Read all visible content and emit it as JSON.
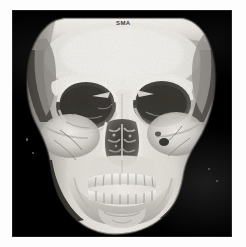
{
  "image": {
    "modality": "CT",
    "render": "3D volume rendering",
    "subject": "human skull",
    "view": "anteroposterior / frontal",
    "background_color": "#000000",
    "border_color": "#ffffff",
    "bone_color_light": "#f2f0ec",
    "bone_color_mid": "#b8b5b0",
    "bone_color_dark": "#5a5854",
    "cavity_color": "#26241f",
    "viewport": {
      "x": 12,
      "y": 10,
      "width": 220,
      "height": 227
    }
  },
  "overlay": {
    "orientation_label": "SMA"
  },
  "anatomy": {
    "regions": [
      {
        "name": "cranial-vault",
        "label": "Calvarium / frontal bone",
        "note": "flat superior cut plane of scan volume"
      },
      {
        "name": "frontal-bone",
        "label": "Frontal bone"
      },
      {
        "name": "orbit-right",
        "label": "Right orbit"
      },
      {
        "name": "orbit-left",
        "label": "Left orbit"
      },
      {
        "name": "nasal-cavity",
        "label": "Nasal cavity with turbinates"
      },
      {
        "name": "zygoma-right",
        "label": "Right zygomatic arch"
      },
      {
        "name": "zygoma-left",
        "label": "Left zygomatic arch"
      },
      {
        "name": "maxilla",
        "label": "Maxilla with upper dentition"
      },
      {
        "name": "mandible",
        "label": "Mandible with lower dentition"
      },
      {
        "name": "chin",
        "label": "Mental symphysis"
      }
    ]
  }
}
